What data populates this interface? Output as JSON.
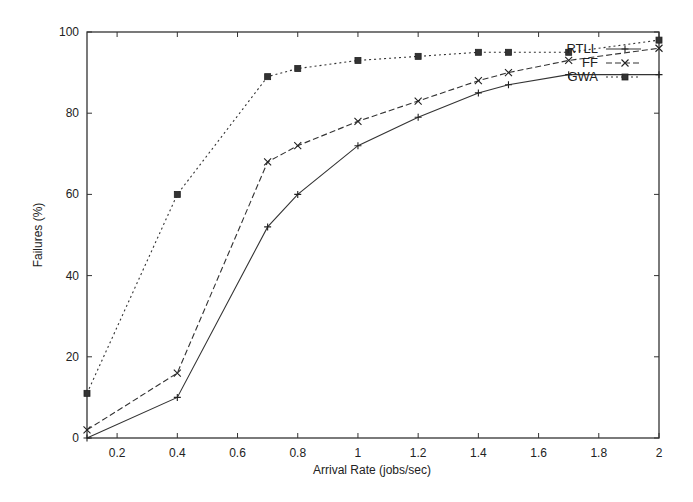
{
  "chart_data": {
    "type": "line",
    "title": "",
    "xlabel": "Arrival Rate (jobs/sec)",
    "ylabel": "Failures (%)",
    "xlim": [
      0.1,
      2
    ],
    "ylim": [
      0,
      100
    ],
    "xticks": [
      0.2,
      0.4,
      0.6,
      0.8,
      1,
      1.2,
      1.4,
      1.6,
      1.8,
      2
    ],
    "xtick_labels": [
      "0.2",
      "0.4",
      "0.6",
      "0.8",
      "1",
      "1.2",
      "1.4",
      "1.6",
      "1.8",
      "2"
    ],
    "yticks": [
      0,
      20,
      40,
      60,
      80,
      100
    ],
    "ytick_labels": [
      "0",
      "20",
      "40",
      "60",
      "80",
      "100"
    ],
    "grid": false,
    "legend_position": "upper right (inside)",
    "x": [
      0.1,
      0.4,
      0.7,
      0.8,
      1.0,
      1.2,
      1.4,
      1.5,
      1.7,
      2.0
    ],
    "series": [
      {
        "name": "RTLL",
        "line_style": "solid",
        "marker": "plus",
        "values": [
          0,
          10,
          52,
          60,
          72,
          79,
          85,
          87,
          89.5,
          89.5
        ]
      },
      {
        "name": "FF",
        "line_style": "dashed",
        "marker": "cross",
        "values": [
          2,
          16,
          68,
          72,
          78,
          83,
          88,
          90,
          93,
          96
        ]
      },
      {
        "name": "GWA",
        "line_style": "dotted",
        "marker": "filled-square",
        "values": [
          11,
          60,
          89,
          91,
          93,
          94,
          95,
          95,
          95,
          98
        ]
      }
    ]
  }
}
